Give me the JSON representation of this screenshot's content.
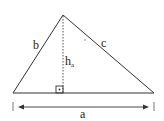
{
  "diagram": {
    "labels": {
      "side_b": "b",
      "side_c": "c",
      "height": "h",
      "height_sub": "a",
      "base": "a"
    },
    "colors": {
      "stroke": "#333333",
      "background": "#ffffff"
    }
  }
}
